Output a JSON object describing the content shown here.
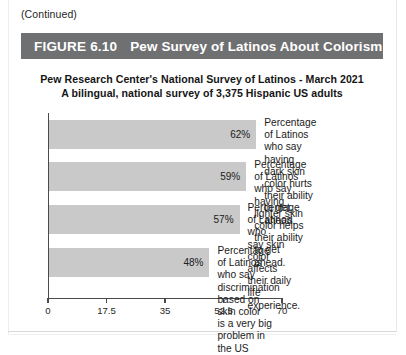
{
  "page": {
    "continued_note": "(Continued)"
  },
  "figure": {
    "number": "FIGURE 6.10",
    "title": "Pew Survey of Latinos About Colorism",
    "banner_color": "#6f7072"
  },
  "chart_data": {
    "type": "bar",
    "orientation": "horizontal",
    "title": "Pew Research Center's National Survey of Latinos - March 2021",
    "subtitle": "A bilingual, national survey of 3,375 Hispanic US adults",
    "xlabel": "",
    "ylabel": "",
    "xlim": [
      0,
      70
    ],
    "xticks": [
      "0",
      "17.5",
      "35",
      "52.5",
      "70"
    ],
    "xtick_values": [
      0,
      17.5,
      35,
      52.5,
      70
    ],
    "grid": false,
    "legend": "none",
    "bar_color": "#c9c9c9",
    "value_suffix": "%",
    "categories": [
      "Percentage of Latinos who say\nhaving dark skin color hurts\ntheir ability to get ahead.",
      "Percentage of Latinos who say\nhaving lighter skin color helps\ntheir ability to get ahead.",
      "Percentage of Latinos who\nsay skin color affects\ntheir daily life experience.",
      "Percentage of Latinos who say\ndiscrimination based on skin color\nis a very big problem in the US"
    ],
    "values": [
      62,
      59,
      57,
      48
    ],
    "value_labels": [
      "62%",
      "59%",
      "57%",
      "48%"
    ]
  }
}
